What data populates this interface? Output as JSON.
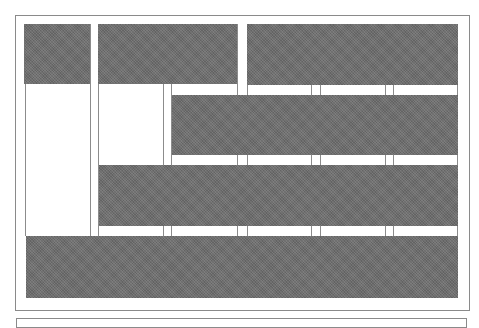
{
  "diagram": {
    "type": "block-tiling",
    "colors": {
      "background": "#ffffff",
      "frame_border": "#8a8a8a",
      "grid_line": "#8c8c8c",
      "block_fill": "#6e6e6e"
    },
    "frames": [
      {
        "id": "main-frame",
        "x": 15,
        "y": 15,
        "w": 455,
        "h": 296
      },
      {
        "id": "lower-frame",
        "x": 16,
        "y": 318,
        "w": 451,
        "h": 10
      }
    ],
    "grid_lines_x": [
      25,
      90,
      98,
      163,
      171,
      237,
      247,
      311,
      320,
      385,
      393,
      457
    ],
    "grid_top": 24,
    "grid_bottom": 236,
    "blocks": [
      {
        "id": "block-a",
        "x": 24,
        "y": 24,
        "w": 66,
        "h": 60
      },
      {
        "id": "block-b",
        "x": 98,
        "y": 24,
        "w": 139,
        "h": 60
      },
      {
        "id": "block-c",
        "x": 247,
        "y": 24,
        "w": 211,
        "h": 61
      },
      {
        "id": "block-d",
        "x": 172,
        "y": 95,
        "w": 286,
        "h": 60
      },
      {
        "id": "block-e",
        "x": 99,
        "y": 165,
        "w": 359,
        "h": 61
      },
      {
        "id": "block-f",
        "x": 26,
        "y": 236,
        "w": 432,
        "h": 62
      }
    ]
  }
}
